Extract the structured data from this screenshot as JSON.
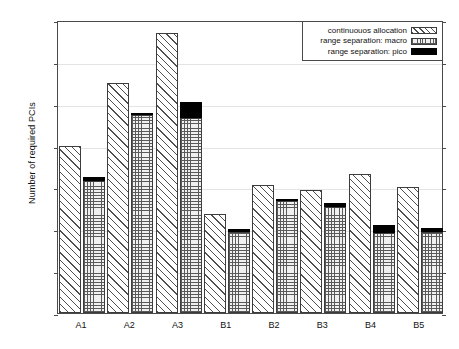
{
  "chart_data": {
    "type": "bar",
    "title": "",
    "xlabel": "",
    "ylabel": "Number of required PCIs",
    "ylim": [
      0,
      350
    ],
    "yticks": [
      0,
      50,
      100,
      150,
      200,
      250,
      300,
      350
    ],
    "grid": true,
    "legend_position": "top-right",
    "categories": [
      "A1",
      "A2",
      "A3",
      "B1",
      "B2",
      "B3",
      "B4",
      "B5"
    ],
    "series": [
      {
        "name": "continuouos allocation",
        "pattern": "diagonal-hatch",
        "values": [
          200,
          275,
          335,
          118,
          153,
          147,
          166,
          151
        ]
      },
      {
        "name": "range separation: macro",
        "pattern": "crosshatch",
        "values": [
          158,
          237,
          233,
          97,
          134,
          127,
          96,
          97
        ]
      },
      {
        "name": "range separation: pico",
        "pattern": "solid-black",
        "stacked_on": "range separation: macro",
        "values": [
          4,
          2,
          19,
          3,
          2,
          4,
          9,
          5
        ],
        "stack_totals": [
          162,
          239,
          252,
          100,
          136,
          131,
          105,
          102
        ]
      }
    ]
  },
  "legend": {
    "items": [
      {
        "label": "continuouos allocation",
        "swatch": "diagonal-hatch-swatch"
      },
      {
        "label": "range separation: macro",
        "swatch": "crosshatch-swatch"
      },
      {
        "label": "range separation: pico",
        "swatch": "solid-black-swatch"
      }
    ]
  },
  "axes": {
    "y_title": "Number of required PCIs",
    "y_tick_labels": [
      "350",
      "300",
      "250",
      "200",
      "150",
      "100",
      "50",
      "0"
    ],
    "x_tick_labels": [
      "A1",
      "A2",
      "A3",
      "B1",
      "B2",
      "B3",
      "B4",
      "B5"
    ]
  },
  "colors": {
    "frame": "#4a4a4a",
    "grid": "#e4e4e4",
    "hatch": "#4f4f4f",
    "pico_fill": "#000000",
    "background": "#ffffff",
    "text": "#111111"
  }
}
